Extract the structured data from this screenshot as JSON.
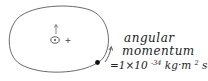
{
  "diagram": {
    "label_line1": "angular",
    "label_line2": "momentum",
    "equation": {
      "prefix": "=1×10",
      "exponent": "-34",
      "unit_kg": " kg·m",
      "unit_m_exp": "2",
      "unit_s": "s",
      "unit_s_exp": "-1"
    },
    "nucleus_symbol": "⊙",
    "charge_symbol": "+",
    "colors": {
      "stroke": "#333333",
      "text": "#222222",
      "electron": "#111111"
    }
  }
}
